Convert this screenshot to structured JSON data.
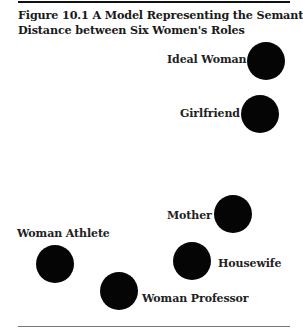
{
  "figure": {
    "title_line1": "Figure 10.1 A Model Representing the Semantic",
    "title_line2": "Distance between Six Women's Roles"
  },
  "roles": [
    {
      "id": "ideal-woman",
      "label": "Ideal Woman",
      "cx": 266,
      "cy": 61
    },
    {
      "id": "girlfriend",
      "label": "Girlfriend",
      "cx": 260,
      "cy": 114
    },
    {
      "id": "mother",
      "label": "Mother",
      "cx": 233,
      "cy": 214
    },
    {
      "id": "housewife",
      "label": "Housewife",
      "cx": 192,
      "cy": 261
    },
    {
      "id": "woman-athlete",
      "label": "Woman Athlete",
      "cx": 55,
      "cy": 264
    },
    {
      "id": "woman-professor",
      "label": "Woman Professor",
      "cx": 119,
      "cy": 291
    }
  ],
  "colors": {
    "node": "#050505",
    "text": "#1a1a1a"
  }
}
